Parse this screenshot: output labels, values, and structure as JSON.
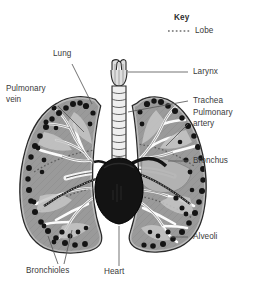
{
  "figure": {
    "type": "anatomical-diagram",
    "background_color": "#ffffff",
    "text_color": "#3a3a3a"
  },
  "key": {
    "title": "Key",
    "entries": [
      {
        "label": "Lobe",
        "style": "dotted-line",
        "color": "#7c7c7c"
      }
    ]
  },
  "labels": {
    "lung": "Lung",
    "pulmonary_vein_line1": "Pulmonary",
    "pulmonary_vein_line2": "vein",
    "bronchioles": "Bronchioles",
    "heart": "Heart",
    "larynx": "Larynx",
    "trachea": "Trachea",
    "pulmonary_artery_line1": "Pulmonary",
    "pulmonary_artery_line2": "artery",
    "bronchus": "Bronchus",
    "alveoli": "Alveoli"
  },
  "colors": {
    "outline": "#2b2b2b",
    "lung_tissue": "#9a9a9a",
    "lung_tissue_light": "#c8c8c8",
    "airway_light": "#ececec",
    "heart_dark": "#121212",
    "alveoli_dark": "#141414",
    "pleura": "#7d7d7d",
    "leader_line": "#5a5a5a",
    "lobe_dotted": "#6e6e6e"
  }
}
